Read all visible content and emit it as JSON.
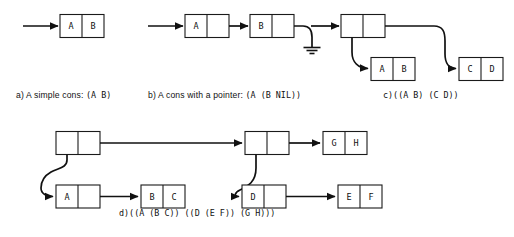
{
  "figure": {
    "background_color": "#ffffff",
    "ink_color": "#111111",
    "box_fill": "#ffffff"
  },
  "panels": [
    {
      "id": "a",
      "label": "a)",
      "caption_prose": " A simple cons: ",
      "caption_code": "(A B)",
      "cells": [
        {
          "name": "cons-a-root",
          "car": "A",
          "cdr": "B"
        }
      ],
      "pointers": [
        "inbound-arrow-to-root"
      ],
      "terminators": []
    },
    {
      "id": "b",
      "label": "b)",
      "caption_prose": " A cons with a pointer: ",
      "caption_code": "(A (B NIL))",
      "cells": [
        {
          "name": "cons-b-first",
          "car": "A",
          "cdr": ""
        },
        {
          "name": "cons-b-second",
          "car": "B",
          "cdr": ""
        }
      ],
      "pointers": [
        "inbound-arrow-to-first",
        "first-cdr-to-second",
        "second-cdr-to-ground"
      ],
      "terminators": [
        "nil-ground-symbol"
      ]
    },
    {
      "id": "c",
      "label": "c)",
      "caption_prose": "",
      "caption_code": "((A B) (C D))",
      "cells": [
        {
          "name": "cons-c-root",
          "car": "",
          "cdr": ""
        },
        {
          "name": "cons-c-left",
          "car": "A",
          "cdr": "B"
        },
        {
          "name": "cons-c-right",
          "car": "C",
          "cdr": "D"
        }
      ],
      "pointers": [
        "inbound-arrow-to-root",
        "root-car-to-left",
        "root-cdr-to-right"
      ],
      "terminators": []
    },
    {
      "id": "d",
      "label": "d)",
      "caption_prose": "",
      "caption_code": "((A (B C)) ((D (E F)) (G H)))",
      "cells": [
        {
          "name": "cons-d-root",
          "car": "",
          "cdr": ""
        },
        {
          "name": "cons-d-a",
          "car": "A",
          "cdr": ""
        },
        {
          "name": "cons-d-bc",
          "car": "B",
          "cdr": "C"
        },
        {
          "name": "cons-d-second",
          "car": "",
          "cdr": ""
        },
        {
          "name": "cons-d-gh",
          "car": "G",
          "cdr": "H"
        },
        {
          "name": "cons-d-d",
          "car": "D",
          "cdr": ""
        },
        {
          "name": "cons-d-ef",
          "car": "E",
          "cdr": "F"
        }
      ],
      "pointers": [
        "root-cdr-to-second",
        "root-car-to-a",
        "a-cdr-to-bc",
        "second-cdr-to-gh",
        "second-car-to-d",
        "d-cdr-to-ef"
      ],
      "terminators": []
    }
  ],
  "cell_text": {
    "a_car": "A",
    "a_cdr": "B",
    "b_first_car": "A",
    "b_second_car": "B",
    "c_left_car": "A",
    "c_left_cdr": "B",
    "c_right_car": "C",
    "c_right_cdr": "D",
    "d_a_car": "A",
    "d_bc_car": "B",
    "d_bc_cdr": "C",
    "d_gh_car": "G",
    "d_gh_cdr": "H",
    "d_d_car": "D",
    "d_ef_car": "E",
    "d_ef_cdr": "F"
  },
  "captions": {
    "a_label": "a)",
    "a_prose": " A simple cons: ",
    "a_code": "(A B)",
    "b_label": "b)",
    "b_prose": " A cons with a pointer: ",
    "b_code": "(A (B NIL))",
    "c_label": "c)",
    "c_code": "((A B) (C D))",
    "d_label": "d)",
    "d_code": "((A (B C)) ((D (E F)) (G H)))"
  }
}
